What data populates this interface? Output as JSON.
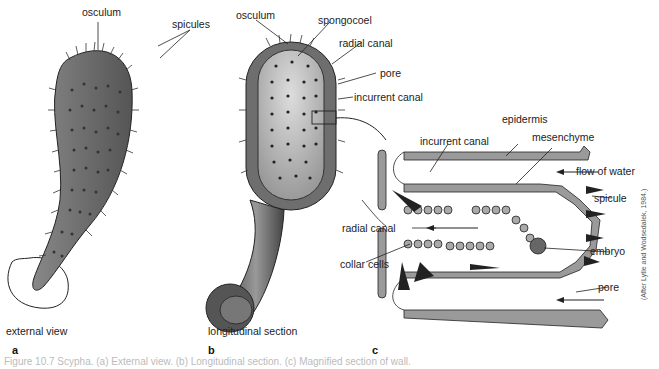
{
  "figure": {
    "caption": "Figure 10.7 Scypha. (a) External view. (b) Longitudinal section. (c) Magnified section of wall.",
    "credit": "(After Lytle and Wodsedalek, 1984.)"
  },
  "panels": [
    {
      "id": "a",
      "letter": "a",
      "title": "external view",
      "labels": [
        "osculum",
        "spicules"
      ]
    },
    {
      "id": "b",
      "letter": "b",
      "title": "longitudinal section",
      "labels": [
        "osculum",
        "spongocoel",
        "radial canal",
        "pore",
        "incurrent canal"
      ]
    },
    {
      "id": "c",
      "letter": "c",
      "title": "",
      "labels": [
        "incurrent canal",
        "epidermis",
        "mesenchyme",
        "flow of water",
        "spicule",
        "radial canal",
        "embryo",
        "collar cells",
        "pore"
      ]
    }
  ],
  "colors": {
    "body_fill": "#6e6e6e",
    "cell_fill": "#9a9a9a",
    "outline": "#222222",
    "caption": "#bbbbbb"
  }
}
